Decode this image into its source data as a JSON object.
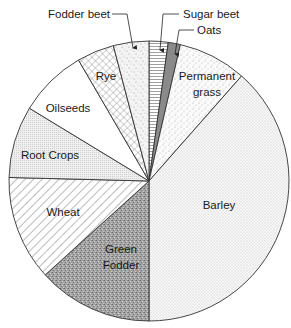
{
  "chart_data": {
    "type": "pie",
    "title": "",
    "start_angle_deg": 0,
    "direction": "clockwise",
    "unit": "percent (estimated from slice angles)",
    "slices": [
      {
        "label": "Sugar beet",
        "value": 2.2,
        "pattern": "horizontal-lines",
        "label_style": "callout"
      },
      {
        "label": "Oats",
        "value": 1.4,
        "pattern": "solid-gray",
        "label_style": "callout"
      },
      {
        "label": "Permanent grass",
        "value": 7.9,
        "pattern": "sparse-dots",
        "label_style": "inside"
      },
      {
        "label": "Barley",
        "value": 38.5,
        "pattern": "fine-dots",
        "label_style": "inside"
      },
      {
        "label": "Green Fodder",
        "value": 13.3,
        "pattern": "dense-gray-speckle",
        "label_style": "inside"
      },
      {
        "label": "Wheat",
        "value": 12.1,
        "pattern": "diagonal-hatch",
        "label_style": "inside"
      },
      {
        "label": "Root Crops",
        "value": 8.3,
        "pattern": "dot-grid",
        "label_style": "inside"
      },
      {
        "label": "Oilseeds",
        "value": 7.9,
        "pattern": "blank",
        "label_style": "inside"
      },
      {
        "label": "Rye",
        "value": 4.3,
        "pattern": "crosshatch",
        "label_style": "inside"
      },
      {
        "label": "Fodder beet",
        "value": 4.1,
        "pattern": "speckle",
        "label_style": "callout"
      }
    ],
    "legend": "none (labels placed on/next to slices)"
  },
  "labels": {
    "sugar_beet": "Sugar beet",
    "oats": "Oats",
    "permanent_line1": "Permanent",
    "permanent_line2": "grass",
    "barley": "Barley",
    "green_line1": "Green",
    "green_line2": "Fodder",
    "wheat": "Wheat",
    "root_crops": "Root Crops",
    "oilseeds": "Oilseeds",
    "rye": "Rye",
    "fodder_beet": "Fodder beet"
  },
  "colors": {
    "outline": "#333333",
    "oats_fill": "#8a8a8a",
    "green_fodder_fill": "#9c9c9c",
    "text": "#1a1a1a"
  }
}
